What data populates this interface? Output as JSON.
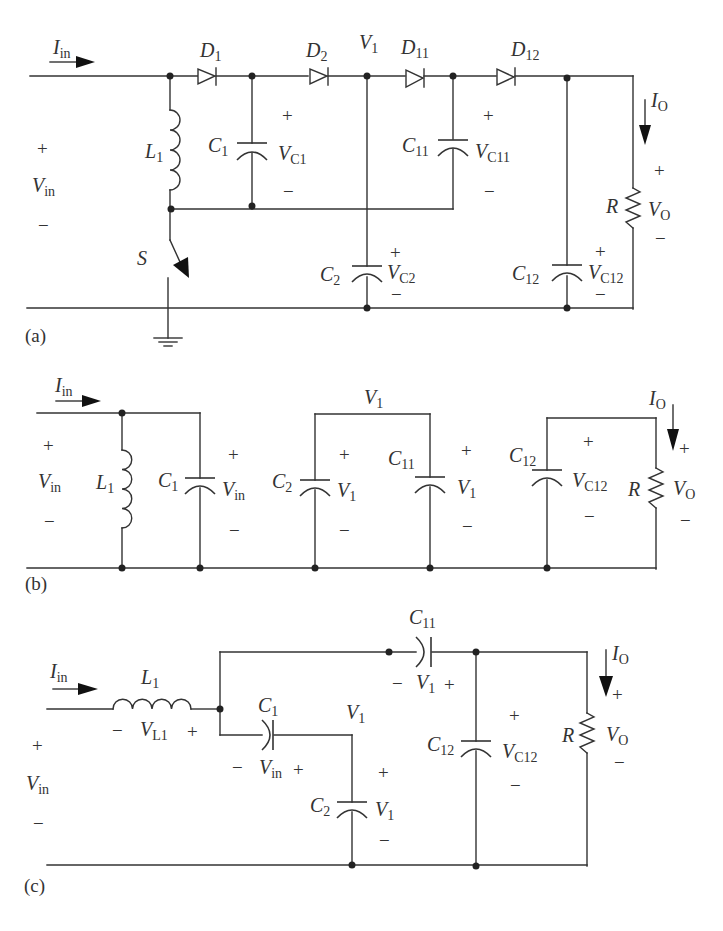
{
  "figure": {
    "panels": [
      {
        "id": "a",
        "caption": "(a)",
        "labels": {
          "input_current": {
            "main": "I",
            "sub": "in"
          },
          "input_voltage": {
            "main": "V",
            "sub": "in",
            "plus": "+",
            "minus": "−"
          },
          "inductor": {
            "main": "L",
            "sub": "1"
          },
          "switch": {
            "main": "S"
          },
          "diode_1": {
            "main": "D",
            "sub": "1"
          },
          "diode_2": {
            "main": "D",
            "sub": "2"
          },
          "diode_11": {
            "main": "D",
            "sub": "11"
          },
          "diode_12": {
            "main": "D",
            "sub": "12"
          },
          "node_v1": {
            "main": "V",
            "sub": "1"
          },
          "cap_1": {
            "main": "C",
            "sub": "1",
            "v_main": "V",
            "v_sub": "C1",
            "plus": "+",
            "minus": "−"
          },
          "cap_2": {
            "main": "C",
            "sub": "2",
            "v_main": "V",
            "v_sub": "C2",
            "plus": "+",
            "minus": "−"
          },
          "cap_11": {
            "main": "C",
            "sub": "11",
            "v_main": "V",
            "v_sub": "C11",
            "plus": "+",
            "minus": "−"
          },
          "cap_12": {
            "main": "C",
            "sub": "12",
            "v_main": "V",
            "v_sub": "C12",
            "plus": "+",
            "minus": "−"
          },
          "load": {
            "main": "R",
            "v_main": "V",
            "v_sub": "O",
            "plus": "+",
            "minus": "−"
          },
          "output_current": {
            "main": "I",
            "sub": "O"
          }
        }
      },
      {
        "id": "b",
        "caption": "(b)",
        "labels": {
          "input_current": {
            "main": "I",
            "sub": "in"
          },
          "input_voltage": {
            "main": "V",
            "sub": "in",
            "plus": "+",
            "minus": "−"
          },
          "inductor": {
            "main": "L",
            "sub": "1"
          },
          "cap_1": {
            "main": "C",
            "sub": "1",
            "v_main": "V",
            "v_sub": "in",
            "plus": "+",
            "minus": "−"
          },
          "node_v1": {
            "main": "V",
            "sub": "1"
          },
          "cap_2": {
            "main": "C",
            "sub": "2",
            "v_main": "V",
            "v_sub": "1",
            "plus": "+",
            "minus": "−"
          },
          "cap_11": {
            "main": "C",
            "sub": "11",
            "v_main": "V",
            "v_sub": "1",
            "plus": "+",
            "minus": "−"
          },
          "cap_12": {
            "main": "C",
            "sub": "12",
            "v_main": "V",
            "v_sub": "C12",
            "plus": "+",
            "minus": "−"
          },
          "load": {
            "main": "R",
            "v_main": "V",
            "v_sub": "O",
            "plus": "+",
            "minus": "−"
          },
          "output_current": {
            "main": "I",
            "sub": "O"
          }
        }
      },
      {
        "id": "c",
        "caption": "(c)",
        "labels": {
          "input_current": {
            "main": "I",
            "sub": "in"
          },
          "input_voltage": {
            "main": "V",
            "sub": "in",
            "plus": "+",
            "minus": "−"
          },
          "inductor": {
            "main": "L",
            "sub": "1",
            "v_main": "V",
            "v_sub": "L1",
            "plus": "+",
            "minus": "−"
          },
          "cap_1": {
            "main": "C",
            "sub": "1",
            "v_main": "V",
            "v_sub": "in",
            "plus": "+",
            "minus": "−"
          },
          "node_v1": {
            "main": "V",
            "sub": "1"
          },
          "cap_2": {
            "main": "C",
            "sub": "2",
            "v_main": "V",
            "v_sub": "1",
            "plus": "+",
            "minus": "−"
          },
          "cap_11": {
            "main": "C",
            "sub": "11",
            "v_main": "V",
            "v_sub": "1",
            "plus": "+",
            "minus": "−"
          },
          "cap_12": {
            "main": "C",
            "sub": "12",
            "v_main": "V",
            "v_sub": "C12",
            "plus": "+",
            "minus": "−"
          },
          "load": {
            "main": "R",
            "v_main": "V",
            "v_sub": "O",
            "plus": "+",
            "minus": "−"
          },
          "output_current": {
            "main": "I",
            "sub": "O"
          }
        }
      }
    ]
  }
}
